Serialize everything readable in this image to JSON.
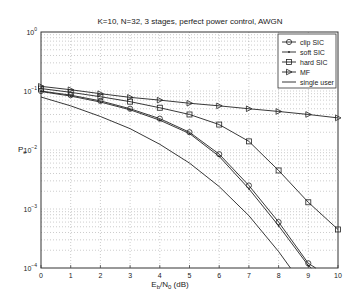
{
  "chart_data": {
    "type": "line",
    "title": "K=10, N=32, 3 stages, perfect power control, AWGN",
    "xlabel": "E_b/N_0 (dB)",
    "ylabel": "P_e",
    "xlim": [
      0,
      10
    ],
    "ylim": [
      0.0001,
      1
    ],
    "yscale": "log",
    "grid": true,
    "legend_position": "upper right",
    "x_ticks": [
      "0",
      "1",
      "2",
      "3",
      "4",
      "5",
      "6",
      "7",
      "8",
      "9",
      "10"
    ],
    "y_ticks": [
      "10^0",
      "10^-1",
      "10^-2",
      "10^-3",
      "10^-4"
    ],
    "series": [
      {
        "name": "clip SIC",
        "marker": "circle",
        "x": [
          0,
          1,
          2,
          3,
          4,
          5,
          6,
          7,
          8,
          9,
          9.25
        ],
        "values": [
          0.1,
          0.085,
          0.068,
          0.05,
          0.034,
          0.02,
          0.0085,
          0.0025,
          0.0006,
          0.00012,
          0.0001
        ]
      },
      {
        "name": "soft SIC",
        "marker": "dot",
        "x": [
          0,
          1,
          2,
          3,
          4,
          5,
          6,
          7,
          8,
          9,
          9.1
        ],
        "values": [
          0.098,
          0.082,
          0.065,
          0.048,
          0.032,
          0.019,
          0.0078,
          0.0022,
          0.00052,
          0.00011,
          0.0001
        ]
      },
      {
        "name": "hard SIC",
        "marker": "square",
        "x": [
          0,
          1,
          2,
          3,
          4,
          5,
          6,
          7,
          8,
          9,
          10
        ],
        "values": [
          0.11,
          0.095,
          0.08,
          0.066,
          0.052,
          0.04,
          0.027,
          0.014,
          0.0045,
          0.0013,
          0.00045
        ]
      },
      {
        "name": "MF",
        "marker": "triangle-right",
        "x": [
          0,
          1,
          2,
          3,
          4,
          5,
          6,
          7,
          8,
          9,
          10
        ],
        "values": [
          0.12,
          0.105,
          0.09,
          0.078,
          0.07,
          0.062,
          0.056,
          0.05,
          0.045,
          0.04,
          0.035
        ]
      },
      {
        "name": "single user",
        "marker": "none",
        "x": [
          0,
          1,
          2,
          3,
          4,
          5,
          6,
          7,
          8,
          8.4
        ],
        "values": [
          0.079,
          0.056,
          0.037,
          0.023,
          0.0125,
          0.006,
          0.0024,
          0.00077,
          0.00019,
          0.0001
        ]
      }
    ]
  },
  "labels": {
    "title": "K=10, N=32, 3 stages, perfect power control, AWGN",
    "xlabel_main": "E",
    "xlabel_sub1": "b",
    "xlabel_mid": "/N",
    "xlabel_sub2": "0",
    "xlabel_end": " (dB)",
    "ylabel_main": "P",
    "ylabel_sub": "e"
  }
}
